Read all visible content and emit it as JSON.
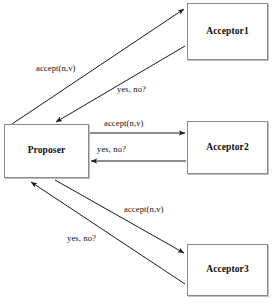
{
  "figure": {
    "caption": "",
    "background_color": "#ffffff",
    "stroke_color": "#1a1a1a",
    "box_border_color": "#8a8a8a",
    "text_color": "#0c0c0c"
  },
  "nodes": [
    {
      "id": "proposer",
      "label": "Proposer",
      "role": "proposer"
    },
    {
      "id": "acceptor1",
      "label": "Acceptor1",
      "role": "acceptor"
    },
    {
      "id": "acceptor2",
      "label": "Acceptor2",
      "role": "acceptor"
    },
    {
      "id": "acceptor3",
      "label": "Acceptor3",
      "role": "acceptor"
    }
  ],
  "edges": [
    {
      "id": "proposer-to-acceptor1",
      "from": "proposer",
      "to": "acceptor1",
      "label": "accept(n,v)",
      "direction": "outbound",
      "style": "diagonal"
    },
    {
      "id": "acceptor1-to-proposer",
      "from": "acceptor1",
      "to": "proposer",
      "label": "yes,  no?",
      "direction": "inbound",
      "style": "diagonal"
    },
    {
      "id": "proposer-to-acceptor2",
      "from": "proposer",
      "to": "acceptor2",
      "label": "accept(n,v)",
      "direction": "outbound",
      "style": "horizontal"
    },
    {
      "id": "acceptor2-to-proposer",
      "from": "acceptor2",
      "to": "proposer",
      "label": "yes,  no?",
      "direction": "inbound",
      "style": "horizontal"
    },
    {
      "id": "proposer-to-acceptor3",
      "from": "proposer",
      "to": "acceptor3",
      "label": "accept(n,v)",
      "direction": "outbound",
      "style": "diagonal"
    },
    {
      "id": "acceptor3-to-proposer",
      "from": "acceptor3",
      "to": "proposer",
      "label": "yes,  no?",
      "direction": "inbound",
      "style": "diagonal"
    }
  ]
}
